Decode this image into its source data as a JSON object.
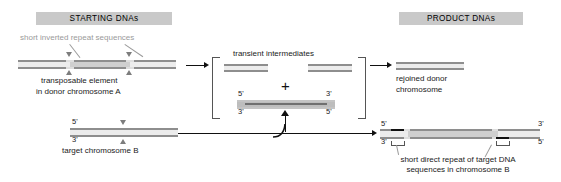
{
  "figure": {
    "title_left": "STARTING DNAs",
    "title_right": "PRODUCT DNAs",
    "middle_caption": "transient intermediates",
    "plus_symbol": "+"
  },
  "left_panel": {
    "annotation_top": "short inverted repeat sequences",
    "donor_caption_line1": "transposable element",
    "donor_caption_line2": "in donor chromosome A",
    "target_caption": "target chromosome B",
    "target_labels": {
      "five_prime_left": "5'",
      "three_prime_left": "3'"
    }
  },
  "intermediate_panel": {
    "caption": "transient intermediates",
    "element_labels": {
      "five_prime_left": "5'",
      "three_prime_right": "3'",
      "three_prime_left": "3'",
      "five_prime_right": "5'"
    }
  },
  "right_panel": {
    "rejoined_line1": "rejoined donor",
    "rejoined_line2": "chromosome",
    "product_labels": {
      "five_prime_left": "5'",
      "three_prime_left": "3'",
      "three_prime_right": "3'",
      "five_prime_right": "5'"
    },
    "product_caption_line1": "short direct repeat of target DNA",
    "product_caption_line2": "sequences in chromosome B"
  },
  "colors": {
    "banner_background": "#c9c9c9",
    "dna_strand": "#8e8e8e",
    "dna_light_segment": "#d8d8d8",
    "direct_repeat_block": "#111111",
    "annotation_gray": "#9a9a9a",
    "arrow": "#111111",
    "page_background": "#ffffff"
  }
}
